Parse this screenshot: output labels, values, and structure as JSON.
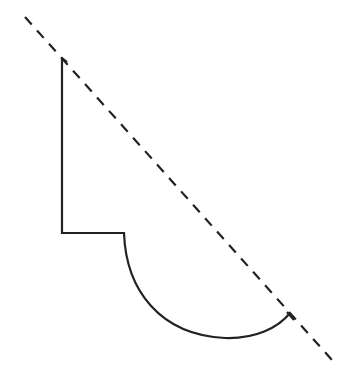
{
  "diagram": {
    "stroke_color": "#222222",
    "background": "#ffffff",
    "dashed_line": {
      "x1": 25,
      "y1": 17,
      "x2": 332,
      "y2": 360,
      "dash": "10,8"
    },
    "shape_path": "M62,58 L62,233 L124,233 C126,290 160,335 225,338 C255,339 278,328 290,313",
    "end_tick": {
      "x1": 287,
      "y1": 312,
      "x2": 294,
      "y2": 320
    },
    "start_tick": {
      "x1": 62,
      "y1": 58,
      "x2": 67,
      "y2": 62
    }
  }
}
